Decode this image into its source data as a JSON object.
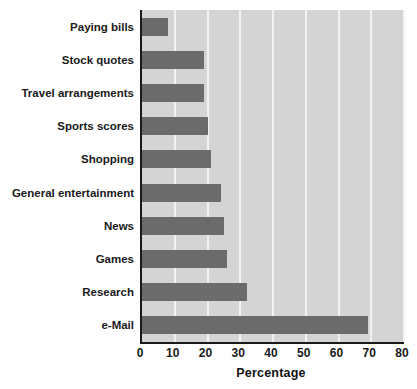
{
  "chart_data": {
    "type": "bar",
    "orientation": "horizontal",
    "title": "",
    "subtitle": "",
    "xlabel": "Percentage",
    "ylabel": "",
    "xlim": [
      0,
      80
    ],
    "xticks": [
      0,
      10,
      20,
      30,
      40,
      50,
      60,
      70,
      80
    ],
    "xtick_labels": [
      "0",
      "10",
      "20",
      "30",
      "40",
      "50",
      "60",
      "70",
      "80"
    ],
    "grid": "vertical-white-gridlines",
    "legend": "none",
    "categories": [
      "Paying bills",
      "Stock quotes",
      "Travel arrangements",
      "Sports scores",
      "Shopping",
      "General entertainment",
      "News",
      "Games",
      "Research",
      "e-Mail"
    ],
    "values": [
      8,
      19,
      19,
      20,
      21,
      24,
      25,
      26,
      32,
      69
    ],
    "series": [
      {
        "name": "Percentage",
        "values": [
          8,
          19,
          19,
          20,
          21,
          24,
          25,
          26,
          32,
          69
        ]
      }
    ]
  },
  "colors": {
    "bar": "#6b6b6b",
    "plot_background": "#d4d4d4",
    "gridline": "#f2f2f2",
    "axis": "#1a1a1a",
    "text": "#1a1a1a",
    "page_background": "#ffffff"
  }
}
